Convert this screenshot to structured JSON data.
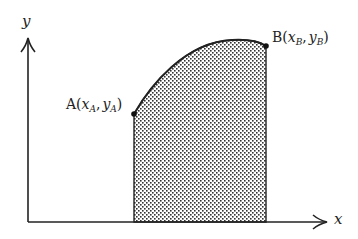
{
  "diagram": {
    "type": "area-under-curve",
    "axes": {
      "x_label": "x",
      "y_label": "y"
    },
    "points": [
      {
        "name": "A",
        "label_prefix": "A(",
        "x_sym": "x",
        "x_sub": "A",
        "sep": ",",
        "y_sym": "y",
        "y_sub": "A",
        "suffix": ")"
      },
      {
        "name": "B",
        "label_prefix": "B(",
        "x_sym": "x",
        "x_sub": "B",
        "sep": ",",
        "y_sym": "y",
        "y_sub": "B",
        "suffix": ")"
      }
    ],
    "region": {
      "description": "shaded area under the curve between x_A and x_B",
      "fill": "stippled dots"
    },
    "colors": {
      "stroke": "#222222",
      "dots": "#333333",
      "background": "#ffffff"
    }
  }
}
